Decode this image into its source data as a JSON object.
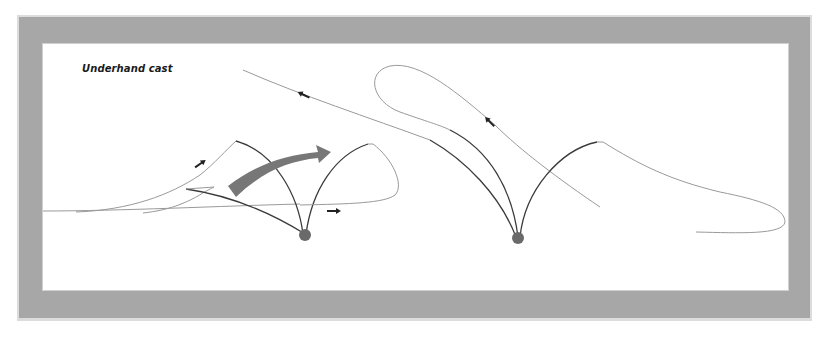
{
  "diagram": {
    "title": "Underhand cast",
    "colors": {
      "frame_band": "#a7a7a7",
      "frame_rim": "#dcdcdc",
      "background": "#ffffff",
      "rod": "#3a3a3a",
      "line": "#9a9a9a",
      "motion_arrow": "#777777",
      "ball": "#6a6a6a",
      "direction_arrow": "#222222"
    },
    "figures": [
      {
        "name": "left-figure",
        "description": "forward underhand stroke with rod sweeping right",
        "motion_arrow": "curved arrow pointing right",
        "direction_arrows": [
          "up-right",
          "right"
        ]
      },
      {
        "name": "right-figure",
        "description": "line loop unrolling with rods sweeping up-left",
        "direction_arrows": [
          "up-left",
          "up-left"
        ]
      }
    ]
  }
}
